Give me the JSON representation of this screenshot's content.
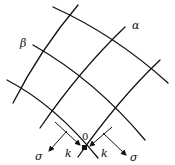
{
  "diagram": {
    "type": "curvilinear-grid-slip-lines",
    "labels": {
      "alpha": "α",
      "beta": "β",
      "origin": "0",
      "k_left": "k",
      "k_right": "k",
      "sigma_left": "σ",
      "sigma_right": "σ"
    },
    "line_families": [
      {
        "name": "alpha",
        "count": 3,
        "direction": "lower-left to upper-right"
      },
      {
        "name": "beta",
        "count": 3,
        "direction": "upper-left to lower-right"
      }
    ],
    "stroke_color": "#111111",
    "background_color": "#ffffff"
  }
}
